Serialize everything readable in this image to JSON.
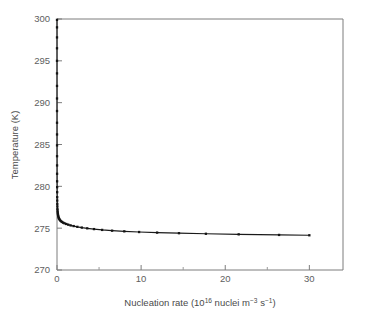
{
  "chart_data": {
    "type": "line",
    "title": "",
    "xlabel_parts": {
      "prefix": "Nucleation rate (10",
      "sup1": "16",
      "mid": " nuclei m",
      "sup2": "−3",
      "mid2": " s",
      "sup3": "−1",
      "suffix": ")"
    },
    "xlabel": "Nucleation rate (10^16 nuclei m^-3 s^-1)",
    "ylabel": "Temperature (K)",
    "xlim": [
      0,
      34
    ],
    "ylim": [
      270,
      300
    ],
    "xticks": [
      0,
      10,
      20,
      30
    ],
    "xticklabels": [
      "0",
      "10",
      "20",
      "30"
    ],
    "xminorticks": [
      5,
      15,
      25
    ],
    "yticks": [
      270,
      275,
      280,
      285,
      290,
      295,
      300
    ],
    "yticklabels": [
      "270",
      "275",
      "280",
      "285",
      "290",
      "295",
      "300"
    ],
    "grid": false,
    "legend": false,
    "marker": "square",
    "series": [
      {
        "name": "Nucleation temperature curve",
        "x": [
          0.0005,
          0.0007,
          0.0009,
          0.0011,
          0.0014,
          0.0017,
          0.0021,
          0.0026,
          0.0032,
          0.004,
          0.005,
          0.006,
          0.0075,
          0.009,
          0.011,
          0.0135,
          0.0165,
          0.02,
          0.025,
          0.03,
          0.037,
          0.045,
          0.055,
          0.067,
          0.082,
          0.1,
          0.12,
          0.15,
          0.18,
          0.22,
          0.27,
          0.33,
          0.4,
          0.49,
          0.6,
          0.73,
          0.89,
          1.09,
          1.33,
          1.62,
          1.98,
          2.42,
          2.95,
          3.6,
          4.4,
          5.37,
          6.55,
          8.0,
          9.76,
          11.9,
          14.5,
          17.7,
          21.6,
          26.4,
          30.0
        ],
        "y": [
          299.9,
          299.0,
          297.8,
          296.5,
          295.0,
          293.5,
          292.0,
          290.5,
          289.0,
          287.6,
          286.2,
          284.9,
          283.6,
          282.5,
          281.5,
          280.6,
          279.9,
          279.3,
          278.7,
          278.3,
          277.9,
          277.6,
          277.3,
          277.1,
          276.9,
          276.75,
          276.6,
          276.45,
          276.3,
          276.2,
          276.1,
          276.0,
          275.9,
          275.82,
          275.74,
          275.66,
          275.58,
          275.5,
          275.42,
          275.33,
          275.25,
          275.16,
          275.07,
          274.98,
          274.89,
          274.79,
          274.7,
          274.62,
          274.54,
          274.47,
          274.4,
          274.33,
          274.26,
          274.19,
          274.15
        ],
        "color": "#141414"
      }
    ]
  },
  "axes": {
    "y_axis_title": "Temperature (K)",
    "x_axis_title": "Nucleation rate (10¹⁶ nuclei m⁻³ s⁻¹)"
  }
}
